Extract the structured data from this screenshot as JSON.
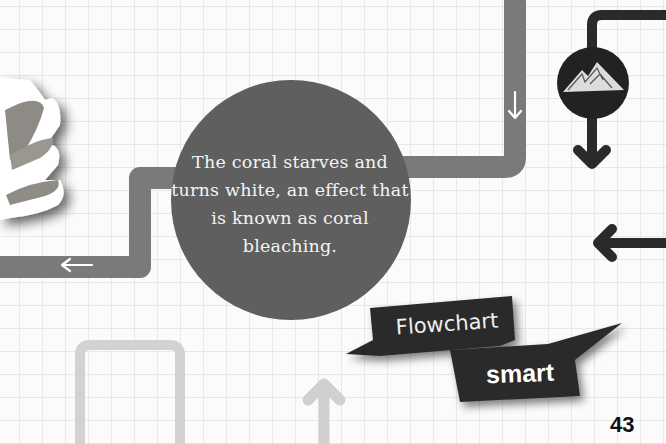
{
  "bubble": {
    "text": "The coral starves and turns white, an effect that is known as coral bleaching."
  },
  "banner": {
    "line1": "Flowchart",
    "line2": "smart"
  },
  "page_number": "43",
  "colors": {
    "background": "#fbfbfb",
    "grid": "#e8e8e8",
    "bubble": "#5f5f5f",
    "path_mid": "#7a7a7a",
    "path_light": "#d0d0d0",
    "path_dark": "#2a2a2a",
    "banner": "#2b2b2b"
  },
  "icons": {
    "coral": "coral-image",
    "mountain": "mountain-icon",
    "arrows": [
      "arrow-left-icon",
      "arrow-down-icon",
      "arrow-up-icon"
    ]
  }
}
